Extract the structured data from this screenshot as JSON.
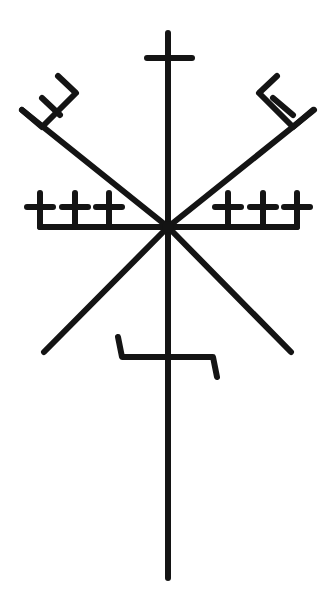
{
  "image": {
    "description": "Icelandic magical stave symbol drawn in black on white",
    "background": "#ffffff",
    "ink": "#141414",
    "stroke_width": 6
  },
  "symbol": {
    "center": [
      168,
      227
    ],
    "vertical_axis": {
      "top": [
        168,
        33
      ],
      "bottom": [
        168,
        578
      ]
    },
    "top_cross": {
      "bar": [
        [
          147,
          58
        ],
        [
          192,
          58
        ]
      ]
    },
    "upper_left_arm": {
      "from": [
        168,
        227
      ],
      "to": [
        22,
        110
      ]
    },
    "upper_right_arm": {
      "from": [
        168,
        227
      ],
      "to": [
        314,
        110
      ]
    },
    "left_trident": [
      [
        [
          42,
          98
        ],
        [
          60,
          115
        ]
      ],
      [
        [
          22,
          110
        ],
        [
          42,
          127
        ],
        [
          76,
          93
        ],
        [
          58,
          76
        ]
      ]
    ],
    "right_trident": [
      [
        [
          273,
          98
        ],
        [
          293,
          115
        ]
      ],
      [
        [
          313,
          110
        ],
        [
          293,
          127
        ],
        [
          259,
          93
        ],
        [
          277,
          76
        ]
      ]
    ],
    "lower_left_arm": {
      "from": [
        168,
        227
      ],
      "to": [
        44,
        352
      ]
    },
    "lower_right_arm": {
      "from": [
        168,
        227
      ],
      "to": [
        291,
        352
      ]
    },
    "left_bar": {
      "from": [
        40,
        227
      ],
      "to": [
        168,
        227
      ],
      "crosses_x": [
        40,
        75,
        109
      ],
      "cross_y": 207,
      "cross_half": 13,
      "cross_top": 193
    },
    "right_bar": {
      "from": [
        168,
        227
      ],
      "to": [
        297,
        227
      ],
      "crosses_x": [
        228,
        263,
        297
      ],
      "cross_y": 207,
      "cross_half": 13,
      "cross_top": 193
    },
    "lower_hook": [
      [
        118,
        337
      ],
      [
        122,
        357
      ],
      [
        213,
        357
      ],
      [
        217,
        377
      ]
    ]
  }
}
